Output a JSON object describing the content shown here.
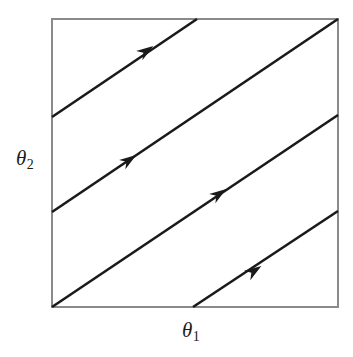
{
  "figure": {
    "kind": "phase-portrait",
    "background_color": "#ffffff"
  },
  "axes": {
    "x_label": "θ",
    "x_subscript": "1",
    "y_label": "θ",
    "y_subscript": "2"
  },
  "chart_data": {
    "type": "line",
    "title": "",
    "xlabel": "θ₁",
    "ylabel": "θ₂",
    "xlim": [
      0,
      1
    ],
    "ylim": [
      0,
      1
    ],
    "grid": false,
    "legend": null,
    "annotations": [
      "Arrows indicate direction of flow (up and to the right)"
    ],
    "frame": {
      "x": 52,
      "y": 19,
      "width": 286,
      "height": 288,
      "stroke": "#8a8a8a",
      "stroke_width": 1.6
    },
    "line_style": {
      "stroke": "#1a1a1a",
      "stroke_width": 2.6,
      "slope": -0.672
    },
    "series": [
      {
        "name": "trajectory-1",
        "x1": 52,
        "y1": 117,
        "x2": 197,
        "y2": 19,
        "arrow_x": 146,
        "arrow_y": 51
      },
      {
        "name": "trajectory-2",
        "x1": 52,
        "y1": 212,
        "x2": 338,
        "y2": 19,
        "arrow_x": 129,
        "arrow_y": 160
      },
      {
        "name": "trajectory-3",
        "x1": 52,
        "y1": 307,
        "x2": 338,
        "y2": 115,
        "arrow_x": 219,
        "arrow_y": 194
      },
      {
        "name": "trajectory-4",
        "x1": 193,
        "y1": 307,
        "x2": 338,
        "y2": 211,
        "arrow_x": 254,
        "arrow_y": 271
      }
    ]
  }
}
